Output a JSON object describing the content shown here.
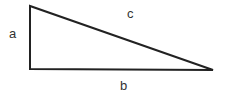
{
  "diagram": {
    "type": "right-triangle",
    "labels": {
      "a": "a",
      "b": "b",
      "c": "c"
    },
    "stroke_color": "#222222",
    "label_color": "#333333"
  }
}
